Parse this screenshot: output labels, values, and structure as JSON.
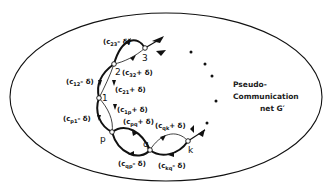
{
  "diagram": {
    "title_lines": [
      "Pseudo-",
      "Communication",
      "net G′"
    ],
    "nodes": [
      {
        "id": "3",
        "label": "3"
      },
      {
        "id": "2",
        "label": "2"
      },
      {
        "id": "1",
        "label": "1"
      },
      {
        "id": "p",
        "label": "p"
      },
      {
        "id": "q",
        "label": "q"
      },
      {
        "id": "k",
        "label": "k"
      }
    ],
    "edge_labels": {
      "c23": {
        "pre": "(c",
        "sub": "23",
        "post": "- δ)"
      },
      "c32": {
        "pre": "(c",
        "sub": "32",
        "post": "+ δ)"
      },
      "c12": {
        "pre": "(c",
        "sub": "12",
        "post": "- δ)"
      },
      "c21": {
        "pre": "(c",
        "sub": "21",
        "post": "+ δ)"
      },
      "c1p": {
        "pre": "(c",
        "sub": "1p",
        "post": "+ δ)"
      },
      "cp1": {
        "pre": "(c",
        "sub": "p1",
        "post": "- δ)"
      },
      "cpq": {
        "pre": "(c",
        "sub": "pq",
        "post": "+ δ)"
      },
      "cqp": {
        "pre": "(c",
        "sub": "qp",
        "post": "- δ)"
      },
      "cqk": {
        "pre": "(c",
        "sub": "qk",
        "post": "+ δ)"
      },
      "ckq": {
        "pre": "(c",
        "sub": "kq",
        "post": "- δ)"
      }
    },
    "colors": {
      "stroke": "#111111",
      "background": "#ffffff"
    }
  }
}
